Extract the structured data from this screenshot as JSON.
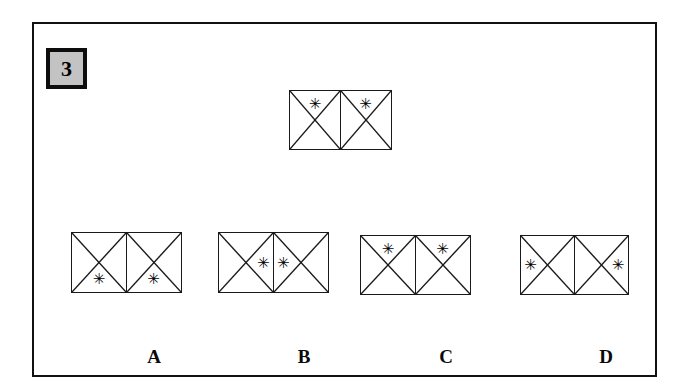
{
  "question": {
    "number": "3",
    "badge_bg": "#c3c3c3",
    "badge_border": "#0d0d0d"
  },
  "frame": {
    "border_color": "#111111",
    "background": "#ffffff"
  },
  "glyphs": {
    "asterisk": "✳",
    "asterisk_name": "asterisk-marker"
  },
  "prompt_figure": {
    "name": "prompt-figure",
    "left": 255,
    "top": 66,
    "cell_width": 52,
    "cell_height": 60,
    "cells": [
      {
        "star_position": "top"
      },
      {
        "star_position": "top"
      }
    ]
  },
  "options": [
    {
      "label": "A",
      "left": 37,
      "top": 208,
      "label_left": 120,
      "label_top": 322,
      "cell_width": 56,
      "cell_height": 61,
      "cells": [
        {
          "star_position": "bottom"
        },
        {
          "star_position": "bottom"
        }
      ]
    },
    {
      "label": "B",
      "left": 184,
      "top": 208,
      "label_left": 270,
      "label_top": 322,
      "cell_width": 56,
      "cell_height": 61,
      "cells": [
        {
          "star_position": "right"
        },
        {
          "star_position": "left"
        }
      ]
    },
    {
      "label": "C",
      "left": 326,
      "top": 211,
      "label_left": 412,
      "label_top": 322,
      "cell_width": 56,
      "cell_height": 60,
      "cells": [
        {
          "star_position": "top"
        },
        {
          "star_position": "top"
        }
      ]
    },
    {
      "label": "D",
      "left": 486,
      "top": 211,
      "label_left": 572,
      "label_top": 322,
      "cell_width": 55,
      "cell_height": 60,
      "cells": [
        {
          "star_position": "left"
        },
        {
          "star_position": "right"
        }
      ]
    }
  ]
}
